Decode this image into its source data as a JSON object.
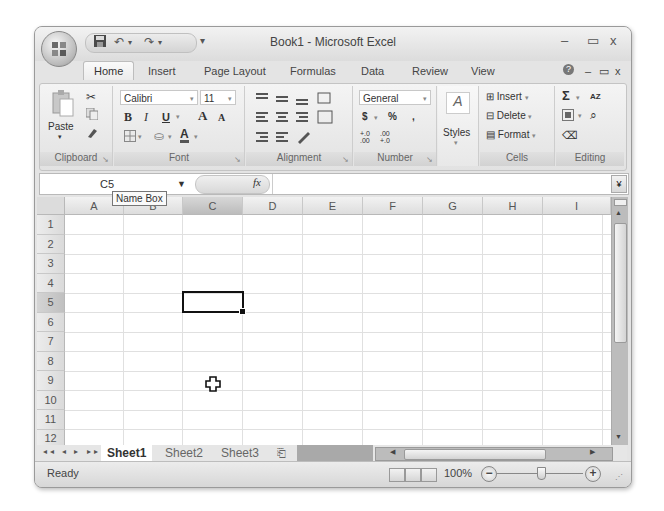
{
  "window": {
    "title": "Book1 - Microsoft Excel",
    "controls": {
      "minimize": "–",
      "maximize": "▭",
      "close": "x"
    },
    "workbook_controls": {
      "help": "?",
      "minimize": "–",
      "restore": "▭",
      "close": "x"
    }
  },
  "qat": {
    "save": "💾",
    "undo": "↶",
    "undo_dd": "▾",
    "redo": "↷",
    "redo_dd": "▾",
    "customize": "▾"
  },
  "ribbon_tabs": [
    {
      "label": "Home",
      "active": true
    },
    {
      "label": "Insert"
    },
    {
      "label": "Page Layout"
    },
    {
      "label": "Formulas"
    },
    {
      "label": "Data"
    },
    {
      "label": "Review"
    },
    {
      "label": "View"
    }
  ],
  "ribbon": {
    "clipboard": {
      "label": "Clipboard",
      "paste": "Paste",
      "paste_dd": "▾"
    },
    "font": {
      "label": "Font",
      "name": "Calibri",
      "size": "11",
      "bold": "B",
      "italic": "I",
      "underline": "U",
      "grow": "A",
      "shrink": "A",
      "color": "A"
    },
    "alignment": {
      "label": "Alignment"
    },
    "number": {
      "label": "Number",
      "format": "General",
      "currency": "$",
      "percent": "%",
      "comma": ",",
      "inc_decimal": "+.0 .00",
      "dec_decimal": ".00 +.0"
    },
    "styles": {
      "label": "Styles",
      "dd": "▾"
    },
    "cells": {
      "label": "Cells",
      "insert": "Insert",
      "delete": "Delete",
      "format": "Format"
    },
    "editing": {
      "label": "Editing",
      "sum": "Σ",
      "sort": "AZ",
      "find": "⌕"
    }
  },
  "formula_bar": {
    "name_box": "C5",
    "fx": "fx",
    "value": "",
    "expand": "¥"
  },
  "tooltip": "Name Box",
  "grid": {
    "columns": [
      "A",
      "B",
      "C",
      "D",
      "E",
      "F",
      "G",
      "H",
      "I"
    ],
    "rows": [
      "1",
      "2",
      "3",
      "4",
      "5",
      "6",
      "7",
      "8",
      "9",
      "10",
      "11",
      "12"
    ],
    "selected_cell": "C5",
    "selected_col": "C",
    "selected_row": "5"
  },
  "sheets": [
    {
      "label": "Sheet1",
      "active": true
    },
    {
      "label": "Sheet2"
    },
    {
      "label": "Sheet3"
    }
  ],
  "sheet_nav": "◂◂ ◂ ▸ ▸▸",
  "status": {
    "text": "Ready",
    "zoom": "100%",
    "zoom_out": "−",
    "zoom_in": "+"
  }
}
